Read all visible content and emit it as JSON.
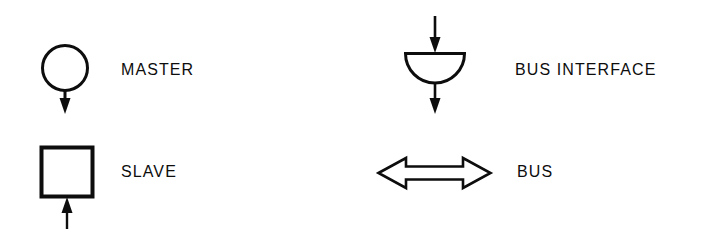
{
  "page": {
    "kind": "symbol-legend",
    "background_color": "#ffffff",
    "ink_color": "#0d0d0d",
    "width": 710,
    "height": 250
  },
  "legend": {
    "entries": [
      {
        "id": "master",
        "label": "MASTER",
        "symbol_name": "circle-with-outgoing-down-arrow",
        "shape": "circle",
        "arrows": "one outgoing arrow pointing down"
      },
      {
        "id": "slave",
        "label": "SLAVE",
        "symbol_name": "square-with-incoming-up-arrow",
        "shape": "square",
        "arrows": "one incoming arrow pointing up into the square"
      },
      {
        "id": "bus-interface",
        "label": "BUS INTERFACE",
        "symbol_name": "half-disc-with-through-arrows",
        "shape": "semicircle",
        "arrows": "incoming arrow from above, outgoing arrow below"
      },
      {
        "id": "bus",
        "label": "BUS",
        "symbol_name": "hollow-double-headed-horizontal-arrow",
        "shape": "double-arrow",
        "arrows": "bidirectional"
      }
    ]
  }
}
